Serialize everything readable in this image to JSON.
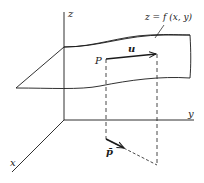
{
  "figure": {
    "axes": {
      "x_label": "x",
      "y_label": "y",
      "z_label": "z"
    },
    "surface_label": "z = f (x, y)",
    "point_label": "P",
    "vector_label": "u",
    "projected_point_label": "p̄",
    "colors": {
      "ink": "#1a1a1a",
      "background": "#ffffff"
    }
  }
}
